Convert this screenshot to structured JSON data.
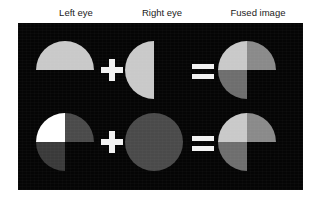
{
  "figure": {
    "panel_background": "#050505",
    "page_background": "#ffffff",
    "columns": [
      {
        "id": "left-eye",
        "label": "Left eye"
      },
      {
        "id": "right-eye",
        "label": "Right eye"
      },
      {
        "id": "fused-image",
        "label": "Fused image"
      }
    ],
    "operators": {
      "plus": "+",
      "equals": "="
    },
    "grays": {
      "white": "#ffffff",
      "light": "#c9c9c9",
      "light_medium": "#b4b4b4",
      "medium": "#8a8a8a",
      "medium_dark": "#6e6e6e",
      "dark": "#4a4a4a",
      "very_dark": "#3a3a3a",
      "black": "#050505"
    },
    "rows": [
      {
        "id": "row-1",
        "left_eye": {
          "shape": "upper-half-disc",
          "regions": [
            {
              "name": "upper-half",
              "gray": "#c9c9c9"
            },
            {
              "name": "lower-half",
              "gray": "#050505"
            }
          ]
        },
        "right_eye": {
          "shape": "left-half-disc",
          "regions": [
            {
              "name": "left-half",
              "gray": "#c9c9c9"
            },
            {
              "name": "right-half",
              "gray": "#050505"
            }
          ]
        },
        "fused_image": {
          "shape": "three-quadrant-disc",
          "regions": [
            {
              "name": "upper-left",
              "gray": "#c9c9c9"
            },
            {
              "name": "upper-right",
              "gray": "#8a8a8a"
            },
            {
              "name": "lower-left",
              "gray": "#6e6e6e"
            },
            {
              "name": "lower-right",
              "gray": "#050505"
            }
          ]
        }
      },
      {
        "id": "row-2",
        "left_eye": {
          "shape": "three-quadrant-disc",
          "regions": [
            {
              "name": "upper-left",
              "gray": "#ffffff"
            },
            {
              "name": "upper-right",
              "gray": "#4a4a4a"
            },
            {
              "name": "lower-left",
              "gray": "#3a3a3a"
            },
            {
              "name": "lower-right",
              "gray": "#050505"
            }
          ]
        },
        "right_eye": {
          "shape": "full-disc",
          "regions": [
            {
              "name": "whole-disc",
              "gray": "#4a4a4a"
            }
          ]
        },
        "fused_image": {
          "shape": "three-quadrant-disc",
          "regions": [
            {
              "name": "upper-left",
              "gray": "#c9c9c9"
            },
            {
              "name": "upper-right",
              "gray": "#8a8a8a"
            },
            {
              "name": "lower-left",
              "gray": "#6e6e6e"
            },
            {
              "name": "lower-right",
              "gray": "#050505"
            }
          ]
        }
      }
    ]
  }
}
